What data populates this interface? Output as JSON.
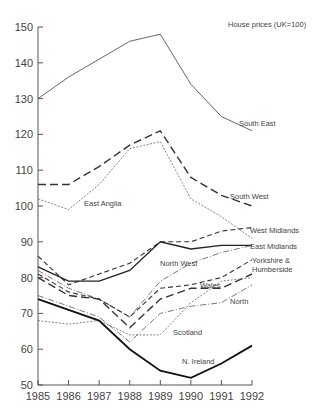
{
  "chart_data": {
    "type": "line",
    "title": "House prices (UK=100)",
    "xlabel": "",
    "ylabel": "",
    "x": [
      1985,
      1986,
      1987,
      1988,
      1989,
      1990,
      1991,
      1992
    ],
    "ylim": [
      50,
      150
    ],
    "yticks": [
      50,
      60,
      70,
      80,
      90,
      100,
      110,
      120,
      130,
      140,
      150
    ],
    "grid": false,
    "legend": "inline labels",
    "series": [
      {
        "name": "South East",
        "values": [
          130,
          136,
          141,
          146,
          148,
          134,
          125,
          121
        ],
        "style": "solid-thin"
      },
      {
        "name": "South West",
        "values": [
          106,
          106,
          111,
          117,
          121,
          108,
          103,
          100
        ],
        "style": "long-dash"
      },
      {
        "name": "East Anglia",
        "values": [
          102,
          99,
          106,
          116,
          118,
          102,
          97,
          91
        ],
        "style": "dotted"
      },
      {
        "name": "West Midlands",
        "values": [
          86,
          78,
          81,
          84,
          90,
          90,
          93,
          94
        ],
        "style": "dash"
      },
      {
        "name": "East Midlands",
        "values": [
          83,
          79,
          79,
          82,
          90,
          88,
          89,
          89
        ],
        "style": "solid"
      },
      {
        "name": "North West",
        "values": [
          82,
          77,
          74,
          69,
          79,
          84,
          87,
          89
        ],
        "style": "dash-dot"
      },
      {
        "name": "Yorkshire & Humberside",
        "values": [
          81,
          76,
          74,
          69,
          77,
          78,
          80,
          85
        ],
        "style": "dash"
      },
      {
        "name": "Wales",
        "values": [
          80,
          75,
          74,
          66,
          74,
          77,
          77,
          81
        ],
        "style": "long-dash"
      },
      {
        "name": "North",
        "values": [
          75,
          72,
          69,
          62,
          70,
          72,
          73,
          78
        ],
        "style": "dash-dot"
      },
      {
        "name": "Scotland",
        "values": [
          68,
          67,
          68,
          64,
          64,
          73,
          79,
          80
        ],
        "style": "dotted"
      },
      {
        "name": "N. Ireland",
        "values": [
          74,
          71,
          68,
          60,
          54,
          52,
          56,
          61
        ],
        "style": "solid-bold"
      }
    ]
  },
  "labels": {
    "title": "House prices (UK=100)",
    "south_east": "South East",
    "south_west": "South West",
    "east_anglia": "East Anglia",
    "west_midlands": "West Midlands",
    "east_midlands": "East Midlands",
    "north_west": "North West",
    "yorkshire_1": "Yorkshire &",
    "yorkshire_2": "Humberside",
    "wales": "Wales",
    "north": "North",
    "scotland": "Scotland",
    "n_ireland": "N. Ireland"
  },
  "axis": {
    "y": [
      "150",
      "140",
      "130",
      "120",
      "110",
      "100",
      "90",
      "80",
      "70",
      "60",
      "50"
    ],
    "x": [
      "1985",
      "1986",
      "1987",
      "1988",
      "1989",
      "1990",
      "1991",
      "1992"
    ]
  }
}
